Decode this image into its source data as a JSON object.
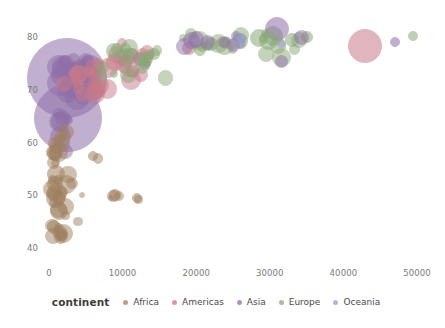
{
  "chart_data": {
    "type": "scatter",
    "title": "",
    "subtitle": "",
    "xlabel": "",
    "ylabel": "",
    "xlim": [
      -2000,
      52000
    ],
    "ylim": [
      38,
      83
    ],
    "xticks": [
      0,
      10000,
      20000,
      30000,
      40000,
      50000
    ],
    "xticklabels": [
      "0",
      "10000",
      "20000",
      "30000",
      "40000",
      "50000"
    ],
    "yticks": [
      40,
      50,
      60,
      70,
      80
    ],
    "yticklabels": [
      "40",
      "50",
      "60",
      "70",
      "80"
    ],
    "grid": false,
    "size_encoding": "population",
    "color_encoding": "continent",
    "legend": {
      "title": "continent",
      "position": "bottom",
      "entries": [
        {
          "label": "Africa",
          "color": "#a08060"
        },
        {
          "label": "Americas",
          "color": "#c87a8a"
        },
        {
          "label": "Asia",
          "color": "#8f6fa8"
        },
        {
          "label": "Europe",
          "color": "#8aa878"
        },
        {
          "label": "Oceania",
          "color": "#9a9ad0"
        }
      ]
    },
    "colors": {
      "Africa": "#a08060",
      "Americas": "#c87a8a",
      "Asia": "#8f6fa8",
      "Europe": "#8aa878",
      "Oceania": "#9a9ad0"
    },
    "points": [
      {
        "x": 2450,
        "y": 72.3,
        "r": 40,
        "c": "Asia"
      },
      {
        "x": 2600,
        "y": 64.7,
        "r": 34,
        "c": "Asia"
      },
      {
        "x": 4950,
        "y": 72.9,
        "r": 16,
        "c": "Americas"
      },
      {
        "x": 4000,
        "y": 71.2,
        "r": 12,
        "c": "Asia"
      },
      {
        "x": 3200,
        "y": 73.5,
        "r": 9,
        "c": "Asia"
      },
      {
        "x": 5100,
        "y": 71.0,
        "r": 11,
        "c": "Americas"
      },
      {
        "x": 8000,
        "y": 74.2,
        "r": 10,
        "c": "Americas"
      },
      {
        "x": 9000,
        "y": 75.3,
        "r": 9,
        "c": "Americas"
      },
      {
        "x": 9800,
        "y": 76.2,
        "r": 8,
        "c": "Americas"
      },
      {
        "x": 10500,
        "y": 75.5,
        "r": 7,
        "c": "Europe"
      },
      {
        "x": 11200,
        "y": 76.4,
        "r": 8,
        "c": "Europe"
      },
      {
        "x": 12400,
        "y": 75.8,
        "r": 7,
        "c": "Asia"
      },
      {
        "x": 13000,
        "y": 74.9,
        "r": 6,
        "c": "Asia"
      },
      {
        "x": 14200,
        "y": 76.8,
        "r": 6,
        "c": "Europe"
      },
      {
        "x": 19000,
        "y": 78.0,
        "r": 7,
        "c": "Americas"
      },
      {
        "x": 20500,
        "y": 77.5,
        "r": 6,
        "c": "Europe"
      },
      {
        "x": 22000,
        "y": 78.6,
        "r": 7,
        "c": "Europe"
      },
      {
        "x": 24000,
        "y": 78.9,
        "r": 6,
        "c": "Europe"
      },
      {
        "x": 26000,
        "y": 79.3,
        "r": 8,
        "c": "Europe"
      },
      {
        "x": 28500,
        "y": 79.8,
        "r": 9,
        "c": "Europe"
      },
      {
        "x": 30500,
        "y": 80.2,
        "r": 10,
        "c": "Europe"
      },
      {
        "x": 31000,
        "y": 81.5,
        "r": 12,
        "c": "Asia"
      },
      {
        "x": 33000,
        "y": 79.4,
        "r": 7,
        "c": "Europe"
      },
      {
        "x": 35000,
        "y": 80.0,
        "r": 6,
        "c": "Europe"
      },
      {
        "x": 43000,
        "y": 78.2,
        "r": 17,
        "c": "Americas"
      },
      {
        "x": 47000,
        "y": 79.0,
        "r": 5,
        "c": "Asia"
      },
      {
        "x": 49500,
        "y": 80.1,
        "r": 5,
        "c": "Europe"
      },
      {
        "x": 800,
        "y": 58.0,
        "r": 8,
        "c": "Africa"
      },
      {
        "x": 900,
        "y": 54.0,
        "r": 9,
        "c": "Africa"
      },
      {
        "x": 1100,
        "y": 50.5,
        "r": 10,
        "c": "Africa"
      },
      {
        "x": 1400,
        "y": 47.0,
        "r": 9,
        "c": "Africa"
      },
      {
        "x": 700,
        "y": 44.0,
        "r": 7,
        "c": "Africa"
      },
      {
        "x": 1800,
        "y": 42.5,
        "r": 6,
        "c": "Africa"
      },
      {
        "x": 6000,
        "y": 57.5,
        "r": 5,
        "c": "Africa"
      },
      {
        "x": 9000,
        "y": 50.0,
        "r": 6,
        "c": "Africa"
      },
      {
        "x": 12000,
        "y": 49.5,
        "r": 5,
        "c": "Africa"
      }
    ]
  },
  "axes": {
    "x_tick_labels": [
      "0",
      "10000",
      "20000",
      "30000",
      "40000",
      "50000"
    ],
    "y_tick_labels": [
      "40",
      "50",
      "60",
      "70",
      "80"
    ]
  },
  "legend": {
    "title": "continent",
    "items": [
      {
        "label": "Africa",
        "color": "#a08060"
      },
      {
        "label": "Americas",
        "color": "#c87a8a"
      },
      {
        "label": "Asia",
        "color": "#8f6fa8"
      },
      {
        "label": "Europe",
        "color": "#8aa878"
      },
      {
        "label": "Oceania",
        "color": "#9a9ad0"
      }
    ]
  }
}
